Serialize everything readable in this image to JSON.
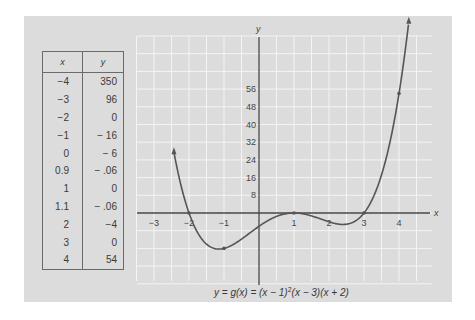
{
  "table": {
    "headers": {
      "x": "x",
      "y": "y"
    },
    "rows": [
      {
        "x": "−4",
        "y": "350"
      },
      {
        "x": "−3",
        "y": "96"
      },
      {
        "x": "−2",
        "y": "0"
      },
      {
        "x": "−1",
        "y": "− 16"
      },
      {
        "x": "0",
        "y": "− 6"
      },
      {
        "x": "0.9",
        "y": "− .06"
      },
      {
        "x": "1",
        "y": "0"
      },
      {
        "x": "1.1",
        "y": "− .06"
      },
      {
        "x": "2",
        "y": "−4"
      },
      {
        "x": "3",
        "y": "0"
      },
      {
        "x": "4",
        "y": "54"
      }
    ]
  },
  "caption": {
    "lhs": "y = g(x) = (x − 1)",
    "exp": "2",
    "rhs": "(x − 3)(x + 2)"
  },
  "chart_data": {
    "type": "line",
    "title": "",
    "function": "y = g(x) = (x - 1)^2 (x - 3)(x + 2)",
    "xlabel": "x",
    "ylabel": "y",
    "x_ticks": [
      -3,
      -2,
      -1,
      1,
      2,
      3,
      4
    ],
    "x_tick_labels": [
      "−3",
      "−2",
      "−1",
      "1",
      "2",
      "3",
      "4"
    ],
    "y_ticks": [
      8,
      16,
      24,
      32,
      40,
      48,
      56
    ],
    "y_tick_labels": [
      "8",
      "16",
      "24",
      "32",
      "40",
      "48",
      "56"
    ],
    "xlim": [
      -3.3,
      5.1
    ],
    "ylim": [
      -32,
      80
    ],
    "grid": true,
    "arrows_at_ends": true,
    "x": [
      -4,
      -3,
      -2,
      -1,
      0,
      0.9,
      1,
      1.1,
      2,
      3,
      4
    ],
    "y": [
      350,
      96,
      0,
      -16,
      -6,
      -0.06,
      0,
      -0.06,
      -4,
      0,
      54
    ],
    "marked_points": [
      [
        -2,
        0
      ],
      [
        -1,
        -16
      ],
      [
        1,
        0
      ],
      [
        3,
        0
      ],
      [
        4,
        54
      ]
    ],
    "colors": {
      "curve": "#555555",
      "axis": "#444444",
      "grid": "#f4f4f4",
      "background": "#dcdcdc"
    }
  }
}
